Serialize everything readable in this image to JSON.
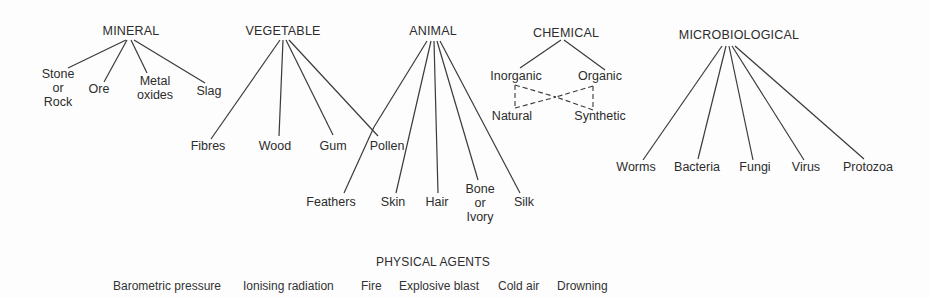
{
  "diagram": {
    "categories": [
      {
        "id": "mineral",
        "label": "MINERAL",
        "children": [
          {
            "label_lines": [
              "Stone",
              "or",
              "Rock"
            ]
          },
          {
            "label_lines": [
              "Ore"
            ]
          },
          {
            "label_lines": [
              "Metal",
              "oxides"
            ]
          },
          {
            "label_lines": [
              "Slag"
            ]
          }
        ]
      },
      {
        "id": "vegetable",
        "label": "VEGETABLE",
        "children": [
          {
            "label_lines": [
              "Fibres"
            ]
          },
          {
            "label_lines": [
              "Wood"
            ]
          },
          {
            "label_lines": [
              "Gum"
            ]
          },
          {
            "label_lines": [
              "Pollen"
            ]
          }
        ]
      },
      {
        "id": "animal",
        "label": "ANIMAL",
        "children": [
          {
            "label_lines": [
              "Pollen"
            ],
            "shared_with": "vegetable"
          },
          {
            "label_lines": [
              "Feathers"
            ]
          },
          {
            "label_lines": [
              "Skin"
            ]
          },
          {
            "label_lines": [
              "Hair"
            ]
          },
          {
            "label_lines": [
              "Bone",
              "or",
              "Ivory"
            ]
          },
          {
            "label_lines": [
              "Silk"
            ]
          }
        ]
      },
      {
        "id": "chemical",
        "label": "CHEMICAL",
        "children": [
          {
            "label_lines": [
              "Inorganic"
            ]
          },
          {
            "label_lines": [
              "Organic"
            ]
          }
        ],
        "cross_links": {
          "style": "dashed",
          "from": [
            "Inorganic",
            "Organic"
          ],
          "to": [
            "Natural",
            "Synthetic"
          ]
        },
        "sub_children": [
          {
            "label_lines": [
              "Natural"
            ]
          },
          {
            "label_lines": [
              "Synthetic"
            ]
          }
        ]
      },
      {
        "id": "microbiological",
        "label": "MICROBIOLOGICAL",
        "children": [
          {
            "label_lines": [
              "Worms"
            ]
          },
          {
            "label_lines": [
              "Bacteria"
            ]
          },
          {
            "label_lines": [
              "Fungi"
            ]
          },
          {
            "label_lines": [
              "Virus"
            ]
          },
          {
            "label_lines": [
              "Protozoa"
            ]
          }
        ]
      }
    ],
    "physical_agents": {
      "label": "PHYSICAL AGENTS",
      "items": [
        "Barometric pressure",
        "Ionising radiation",
        "Fire",
        "Explosive blast",
        "Cold air",
        "Drowning"
      ]
    },
    "colors": {
      "line": "#3a3a3a",
      "text": "#2c2c2c",
      "background": "#fdfdfd"
    }
  }
}
